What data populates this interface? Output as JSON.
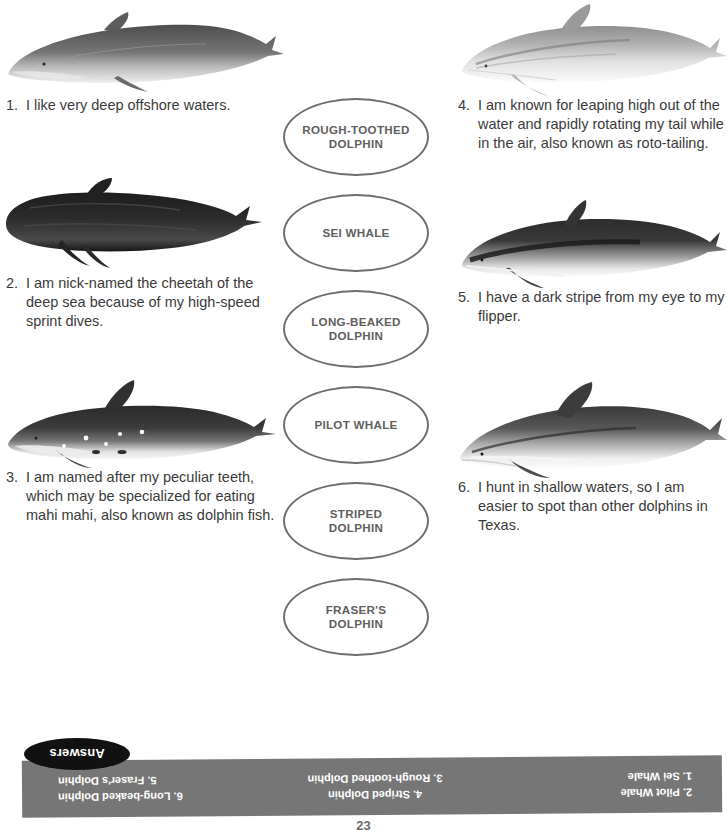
{
  "worksheet": {
    "clues_left": [
      {
        "number": "1.",
        "text": "I like very deep offshore waters.",
        "illustration": "sei-whale-illustration"
      },
      {
        "number": "2.",
        "text": "I am nick-named the cheetah of the deep sea because of my high-speed sprint dives.",
        "illustration": "pilot-whale-illustration"
      },
      {
        "number": "3.",
        "text": "I am named after my peculiar teeth, which may be specialized for eating mahi mahi, also known as dolphin fish.",
        "illustration": "rough-toothed-dolphin-illustration"
      }
    ],
    "clues_right": [
      {
        "number": "4.",
        "text": "I am known for leaping high out of the water and rapidly rotating my tail while in the air, also known as roto-tailing.",
        "illustration": "striped-dolphin-illustration"
      },
      {
        "number": "5.",
        "text": "I have a dark stripe from my eye to my flipper.",
        "illustration": "frasers-dolphin-illustration"
      },
      {
        "number": "6.",
        "text": "I hunt in shallow waters, so I am easier to spot than other dolphins in Texas.",
        "illustration": "long-beaked-dolphin-illustration"
      }
    ],
    "name_ovals": [
      {
        "line1": "ROUGH-TOOTHED",
        "line2": "DOLPHIN"
      },
      {
        "line1": "SEI WHALE",
        "line2": ""
      },
      {
        "line1": "LONG-BEAKED",
        "line2": "DOLPHIN"
      },
      {
        "line1": "PILOT WHALE",
        "line2": ""
      },
      {
        "line1": "STRIPED",
        "line2": "DOLPHIN"
      },
      {
        "line1": "FRASER'S",
        "line2": "DOLPHIN"
      }
    ],
    "answers": {
      "tab_label": "Answers",
      "columns": [
        {
          "top": "2. Pilot Whale",
          "bottom": "1. Sei Whale"
        },
        {
          "top": "4. Striped Dolphin",
          "bottom": "3. Rough-toothed Dolphin"
        },
        {
          "top": "6. Long-beaked Dolphin",
          "bottom": "5. Fraser's Dolphin"
        }
      ]
    },
    "page_number": "23",
    "colors": {
      "oval_border": "#6e6e6e",
      "oval_text": "#5e5e5e",
      "body_text": "#3a3a3a",
      "answers_bar": "#767676",
      "answers_text": "#ffffff",
      "answers_tab": "#111111"
    }
  }
}
